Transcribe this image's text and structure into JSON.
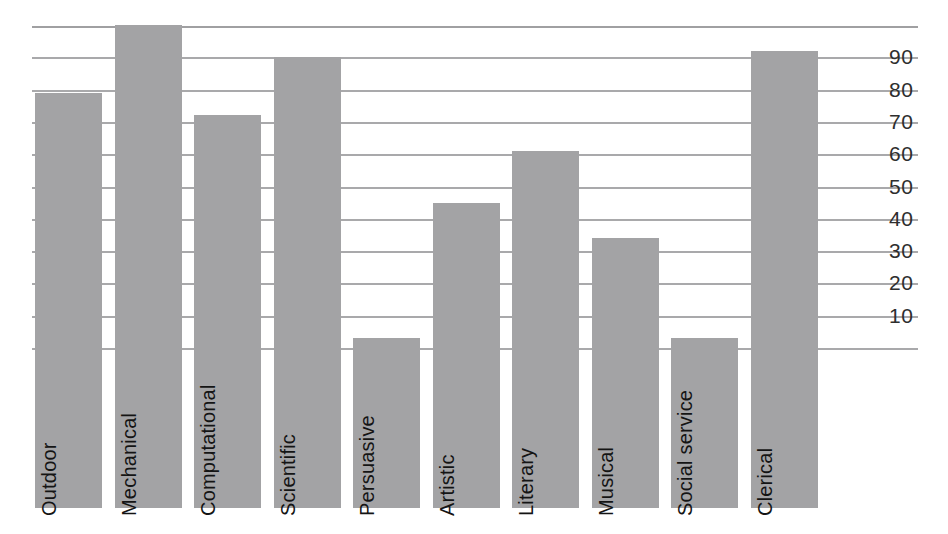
{
  "chart_data": {
    "type": "bar",
    "title": "",
    "subtitle": "",
    "xlabel": "",
    "ylabel": "",
    "ylim": [
      0,
      100
    ],
    "grid": true,
    "legend": null,
    "orientation": "vertical",
    "bar_color": "#a3a3a5",
    "gridline_color": "#a9a9ab",
    "tick_label_color": "#2e2e2e",
    "bar_label_color": "#141414",
    "bar_label_rotation": -90,
    "y_ticks": [
      10,
      20,
      30,
      40,
      50,
      60,
      70,
      80,
      90
    ],
    "y_tick_labels": [
      "10",
      "20",
      "30",
      "40",
      "50",
      "60",
      "70",
      "80",
      "90"
    ],
    "categories": [
      "Outdoor",
      "Mechanical",
      "Computational",
      "Scientific",
      "Persuasive",
      "Artistic",
      "Literary",
      "Musical",
      "Social service",
      "Clerical"
    ],
    "values": [
      79,
      100,
      72,
      90,
      3,
      45,
      61,
      34,
      3,
      92
    ]
  }
}
